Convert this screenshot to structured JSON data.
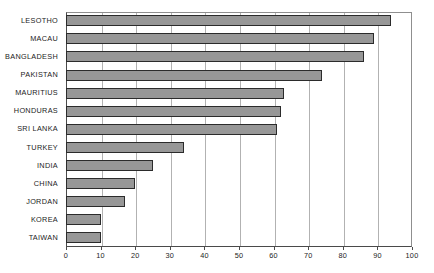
{
  "chart_data": {
    "type": "bar",
    "orientation": "horizontal",
    "title": "",
    "subtitle": "",
    "xlabel": "",
    "ylabel": "",
    "xlim": [
      0,
      100
    ],
    "xticks": [
      0,
      10,
      20,
      30,
      40,
      50,
      60,
      70,
      80,
      90,
      100
    ],
    "grid": "vertical",
    "legend": "none",
    "categories": [
      "LESOTHO",
      "MACAU",
      "BANGLADESH",
      "PAKISTAN",
      "MAURITIUS",
      "HONDURAS",
      "SRI LANKA",
      "TURKEY",
      "INDIA",
      "CHINA",
      "JORDAN",
      "KOREA",
      "TAIWAN"
    ],
    "values": [
      94,
      89,
      86,
      74,
      63,
      62,
      61,
      34,
      25,
      20,
      17,
      10,
      10
    ],
    "series": [
      {
        "name": "",
        "values": [
          94,
          89,
          86,
          74,
          63,
          62,
          61,
          34,
          25,
          20,
          17,
          10,
          10
        ]
      }
    ],
    "colors": {
      "bar_fill": "#979797",
      "bar_border": "#2b2b2b",
      "gridline": "#b2b2b2",
      "axis": "#4a4a4a",
      "background": "#ffffff",
      "text": "#1c1c1c"
    }
  }
}
